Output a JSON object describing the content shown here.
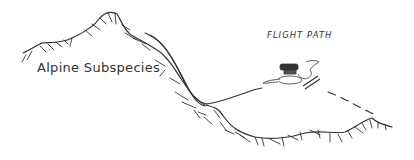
{
  "diagram": {
    "labels": {
      "habitat": "Alpine Subspecies",
      "path": "FLIGHT PATH"
    },
    "colors": {
      "ink": "#333333",
      "background": "#ffffff"
    }
  }
}
